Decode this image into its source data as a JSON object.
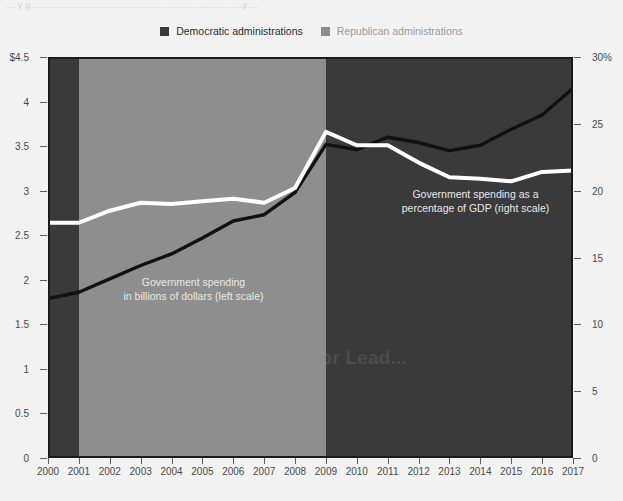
{
  "top_bleed_text": "....y g.........................................................................y....",
  "watermark_text": "...ens and the Senior Lead...",
  "legend": {
    "items": [
      {
        "label": "Democratic administrations",
        "color": "#2b2b2b"
      },
      {
        "label": "Republican administrations",
        "color": "#b0b0b0"
      }
    ]
  },
  "annotations": {
    "gdp": "Government spending as a\npercentage of GDP (right scale)",
    "gdp_line1": "Government spending as a",
    "gdp_line2": "percentage of GDP (right scale)",
    "dollars_line1": "Government spending",
    "dollars_line2": "in billions of dollars (left scale)"
  },
  "colors": {
    "democratic_band": "#3a3a3a",
    "republican_band": "#8e8e8e",
    "dollars_line": "#111111",
    "gdp_line": "#ffffff",
    "page_background": "#f2f2f2",
    "frame": "#1b1b1b"
  },
  "chart_data": {
    "type": "line",
    "title": "",
    "xlabel": "",
    "grid": false,
    "legend_position": "top-center",
    "x": [
      2000,
      2001,
      2002,
      2003,
      2004,
      2005,
      2006,
      2007,
      2008,
      2009,
      2010,
      2011,
      2012,
      2013,
      2014,
      2015,
      2016,
      2017
    ],
    "xticklabels": [
      "2000",
      "2001",
      "2002",
      "2003",
      "2004",
      "2005",
      "2006",
      "2007",
      "2008",
      "2009",
      "2010",
      "2011",
      "2012",
      "2013",
      "2014",
      "2015",
      "2016",
      "2017"
    ],
    "axes": [
      {
        "id": "left",
        "label": "Government spending in billions of dollars (left scale)",
        "ylim": [
          0,
          4.5
        ],
        "yticks": [
          0,
          0.5,
          1,
          1.5,
          2,
          2.5,
          3,
          3.5,
          4,
          4.5
        ],
        "yticklabels": [
          "0",
          "0.5",
          "1",
          "1.5",
          "2",
          "2.5",
          "3",
          "3.5",
          "4",
          "$4.5"
        ]
      },
      {
        "id": "right",
        "label": "Government spending as a percentage of GDP (right scale)",
        "ylim": [
          0,
          30
        ],
        "yticks": [
          0,
          5,
          10,
          15,
          20,
          25,
          30
        ],
        "yticklabels": [
          "0",
          "5",
          "10",
          "15",
          "20",
          "25",
          "30%"
        ]
      }
    ],
    "series": [
      {
        "name": "Government spending in billions of dollars (left scale)",
        "axis": "left",
        "color": "#111111",
        "values": [
          1.79,
          1.86,
          2.01,
          2.16,
          2.29,
          2.47,
          2.66,
          2.73,
          2.98,
          3.52,
          3.46,
          3.6,
          3.54,
          3.45,
          3.51,
          3.69,
          3.85,
          4.15
        ]
      },
      {
        "name": "Government spending as a percentage of GDP (right scale)",
        "axis": "right",
        "color": "#ffffff",
        "values": [
          17.6,
          17.6,
          18.5,
          19.1,
          19.0,
          19.2,
          19.4,
          19.1,
          20.2,
          24.4,
          23.4,
          23.4,
          22.1,
          21.0,
          20.9,
          20.7,
          21.4,
          21.5
        ]
      }
    ],
    "bands": [
      {
        "label": "Democratic administrations",
        "x_start": 2000,
        "x_end": 2001,
        "color": "#3a3a3a"
      },
      {
        "label": "Republican administrations",
        "x_start": 2001,
        "x_end": 2009,
        "color": "#8e8e8e"
      },
      {
        "label": "Democratic administrations",
        "x_start": 2009,
        "x_end": 2017,
        "color": "#3a3a3a"
      }
    ]
  }
}
